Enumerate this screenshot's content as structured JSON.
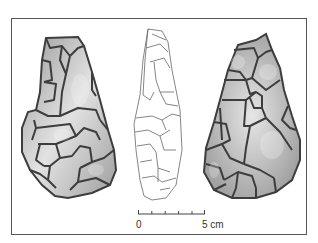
{
  "figure": {
    "views": [
      {
        "id": "face-a",
        "style": "shaded"
      },
      {
        "id": "profile",
        "style": "outline"
      },
      {
        "id": "face-b",
        "style": "shaded"
      }
    ],
    "scale_bar": {
      "start_label": "0",
      "end_label": "5 cm",
      "ticks": 6
    },
    "colors": {
      "frame": "#555555",
      "scar_line": "#3d3d3d",
      "fill_light": "#e4e4e4",
      "fill_dark": "#8a8a8a",
      "profile_line": "#666666"
    }
  }
}
